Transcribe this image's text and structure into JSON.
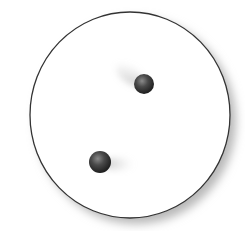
{
  "diagram": {
    "container": {
      "cx": 130,
      "cy": 115,
      "rx": 100,
      "ry": 103,
      "stroke": "#333333",
      "fill": "#ffffff",
      "shadow": "#bbbbbb"
    },
    "balls": [
      {
        "id": "ball-top",
        "cx": 144,
        "cy": 84,
        "r": 10,
        "color": "#3a3a3a",
        "trail_direction": "upper-left"
      },
      {
        "id": "ball-bottom",
        "cx": 100,
        "cy": 162,
        "r": 11,
        "color": "#3a3a3a",
        "trail_direction": "right"
      }
    ]
  }
}
